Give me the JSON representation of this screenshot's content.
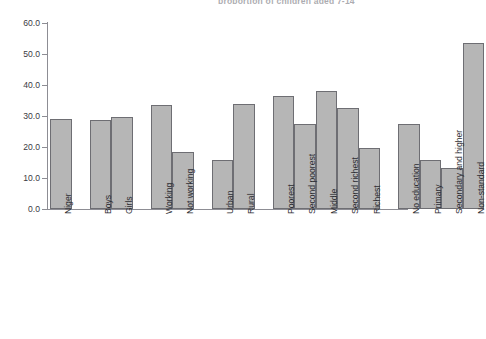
{
  "title_fragment": "proportion of children aged 7-14",
  "axis": {
    "y_ticks": [
      "60.0",
      "50.0",
      "40.0",
      "30.0",
      "20.0",
      "10.0",
      "0.0"
    ]
  },
  "chart_data": {
    "type": "bar",
    "title": "",
    "xlabel": "",
    "ylabel": "",
    "ylim": [
      0,
      60
    ],
    "ytick_values": [
      0,
      10,
      20,
      30,
      40,
      50,
      60
    ],
    "grid": false,
    "legend": "none",
    "bar_color": "#b6b6b6",
    "bar_edge_color": "#6e6e73",
    "categories": [
      "Niger",
      "Boys",
      "Girls",
      "Working",
      "Not working",
      "Urban",
      "Rural",
      "Poorest",
      "Second poorest",
      "Middle",
      "Second richest",
      "Richest",
      "No education",
      "Primary",
      "Secondary and higher",
      "Non-standard"
    ],
    "values": [
      29.0,
      28.8,
      29.7,
      33.5,
      18.4,
      15.9,
      33.9,
      36.5,
      27.3,
      38.2,
      32.7,
      19.8,
      27.3,
      15.7,
      13.1,
      53.4
    ],
    "groups": [
      {
        "name": "Total",
        "categories": [
          "Niger"
        ]
      },
      {
        "name": "Sex",
        "categories": [
          "Boys",
          "Girls"
        ]
      },
      {
        "name": "Work status",
        "categories": [
          "Working",
          "Not working"
        ]
      },
      {
        "name": "Residence",
        "categories": [
          "Urban",
          "Rural"
        ]
      },
      {
        "name": "Wealth quintile",
        "categories": [
          "Poorest",
          "Second poorest",
          "Middle",
          "Second richest",
          "Richest"
        ]
      },
      {
        "name": "Mother's education",
        "categories": [
          "No education",
          "Primary",
          "Secondary and higher",
          "Non-standard"
        ]
      }
    ]
  }
}
